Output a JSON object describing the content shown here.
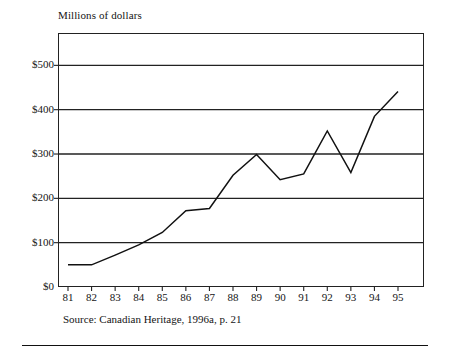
{
  "chart_data": {
    "type": "line",
    "title": "Millions of dollars",
    "xlabel": "",
    "ylabel": "",
    "grid": true,
    "legend": "none",
    "x": [
      "81",
      "82",
      "83",
      "84",
      "85",
      "86",
      "87",
      "88",
      "89",
      "90",
      "91",
      "92",
      "93",
      "94",
      "95"
    ],
    "categories": [
      "81",
      "82",
      "83",
      "84",
      "85",
      "86",
      "87",
      "88",
      "89",
      "90",
      "91",
      "92",
      "93",
      "94",
      "95"
    ],
    "values": [
      50,
      50,
      72,
      95,
      123,
      172,
      177,
      252,
      299,
      242,
      255,
      352,
      258,
      385,
      441
    ],
    "series": [
      {
        "name": "Millions of dollars",
        "values": [
          50,
          50,
          72,
          95,
          123,
          172,
          177,
          252,
          299,
          242,
          255,
          352,
          258,
          385,
          441
        ]
      }
    ],
    "ylim": [
      0,
      573
    ],
    "ytick_values": [
      0,
      100,
      200,
      300,
      400,
      500
    ],
    "ytick_labels": [
      "$0",
      "$100",
      "$200",
      "$300",
      "$400",
      "$500"
    ],
    "xtick_labels": [
      "81",
      "82",
      "83",
      "84",
      "85",
      "86",
      "87",
      "88",
      "89",
      "90",
      "91",
      "92",
      "93",
      "94",
      "95"
    ],
    "annotations": []
  },
  "caption": {
    "source_note": "Source: Canadian Heritage, 1996a, p. 21"
  }
}
